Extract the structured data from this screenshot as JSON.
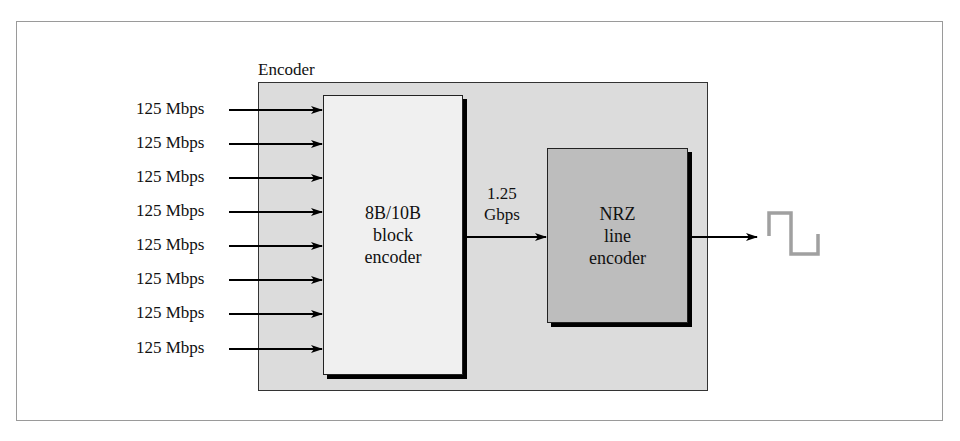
{
  "diagram": {
    "container_label": "Encoder",
    "inputs": [
      {
        "label": "125 Mbps"
      },
      {
        "label": "125 Mbps"
      },
      {
        "label": "125 Mbps"
      },
      {
        "label": "125 Mbps"
      },
      {
        "label": "125 Mbps"
      },
      {
        "label": "125 Mbps"
      },
      {
        "label": "125 Mbps"
      },
      {
        "label": "125 Mbps"
      }
    ],
    "block_encoder": {
      "line1": "8B/10B",
      "line2": "block",
      "line3": "encoder"
    },
    "link_rate": {
      "line1": "1.25",
      "line2": "Gbps"
    },
    "line_encoder": {
      "line1": "NRZ",
      "line2": "line",
      "line3": "encoder"
    },
    "output_signal": "square-wave-icon",
    "colors": {
      "container_fill": "#dcdcdc",
      "block_encoder_fill": "#f0f0f0",
      "line_encoder_fill": "#bdbdbd",
      "waveform": "#a0a0a0"
    }
  }
}
